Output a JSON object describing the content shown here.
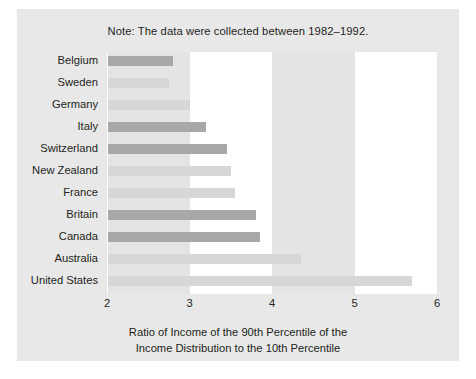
{
  "note": "Note: The data were collected between 1982–1992.",
  "axis_title_line1": "Ratio of Income of the 90th Percentile of the",
  "axis_title_line2": "Income Distribution to the 10th Percentile",
  "colors": {
    "panel_background": "#e8e8e8",
    "band_shaded": "#e4e4e4",
    "band_plain": "#ffffff",
    "bar_light": "#d7d7d7",
    "bar_dark": "#a8a8a8",
    "text": "#231f20"
  },
  "chart_data": {
    "type": "bar",
    "orientation": "horizontal",
    "title": "",
    "subtitle": "",
    "note": "Note: The data were collected between 1982–1992.",
    "xlabel": "Ratio of Income of the 90th Percentile of the Income Distribution to the 10th Percentile",
    "ylabel": "",
    "xlim": [
      2,
      6
    ],
    "xticks": [
      2,
      3,
      4,
      5,
      6
    ],
    "xtick_labels": [
      "2",
      "3",
      "4",
      "5",
      "6"
    ],
    "grid": false,
    "legend": null,
    "bands": [
      {
        "from": 2,
        "to": 3,
        "shaded": true
      },
      {
        "from": 3,
        "to": 4,
        "shaded": false
      },
      {
        "from": 4,
        "to": 5,
        "shaded": true
      },
      {
        "from": 5,
        "to": 6,
        "shaded": false
      }
    ],
    "categories": [
      "Belgium",
      "Sweden",
      "Germany",
      "Italy",
      "Switzerland",
      "New Zealand",
      "France",
      "Britain",
      "Canada",
      "Australia",
      "United States"
    ],
    "values": [
      2.8,
      2.75,
      3.0,
      3.2,
      3.45,
      3.5,
      3.55,
      3.8,
      3.85,
      4.35,
      5.7
    ],
    "shades": [
      "dark",
      "light",
      "light",
      "dark",
      "dark",
      "light",
      "light",
      "dark",
      "dark",
      "light",
      "light"
    ]
  }
}
